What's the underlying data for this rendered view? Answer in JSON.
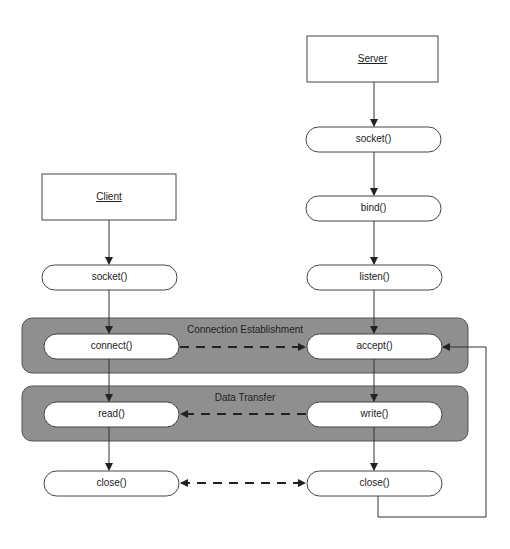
{
  "diagram": {
    "colors": {
      "group_fill": "#8f8f8f",
      "node_fill": "#ffffff",
      "line": "#333333"
    },
    "server": {
      "header": "Server",
      "nodes": [
        "socket()",
        "bind()",
        "listen()",
        "accept()",
        "write()",
        "close()"
      ]
    },
    "client": {
      "header": "Client",
      "nodes": [
        "socket()",
        "connect()",
        "read()",
        "close()"
      ]
    },
    "groups": [
      {
        "label": "Connection Establishment",
        "contains": [
          "connect()",
          "accept()"
        ]
      },
      {
        "label": "Data Transfer",
        "contains": [
          "read()",
          "write()"
        ]
      }
    ],
    "edges": [
      {
        "from": "Server",
        "to": "server.socket()",
        "style": "solid"
      },
      {
        "from": "server.socket()",
        "to": "bind()",
        "style": "solid"
      },
      {
        "from": "bind()",
        "to": "listen()",
        "style": "solid"
      },
      {
        "from": "listen()",
        "to": "accept()",
        "style": "solid"
      },
      {
        "from": "accept()",
        "to": "write()",
        "style": "solid"
      },
      {
        "from": "write()",
        "to": "server.close()",
        "style": "solid"
      },
      {
        "from": "server.close()",
        "to": "accept()",
        "style": "solid-loop"
      },
      {
        "from": "Client",
        "to": "client.socket()",
        "style": "solid"
      },
      {
        "from": "client.socket()",
        "to": "connect()",
        "style": "solid"
      },
      {
        "from": "connect()",
        "to": "read()",
        "style": "solid"
      },
      {
        "from": "read()",
        "to": "client.close()",
        "style": "solid"
      },
      {
        "from": "connect()",
        "to": "accept()",
        "style": "dashed"
      },
      {
        "from": "write()",
        "to": "read()",
        "style": "dashed"
      },
      {
        "from": "client.close()",
        "to": "server.close()",
        "style": "dashed-bidirectional"
      }
    ]
  }
}
